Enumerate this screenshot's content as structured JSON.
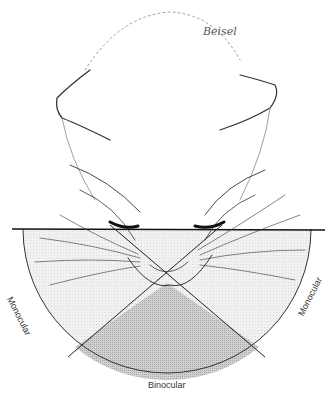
{
  "diagram": {
    "signature": "Beisel",
    "labels": {
      "left": "Monocular",
      "right": "Monocular",
      "bottom": "Binocular"
    },
    "colors": {
      "line": "#222222",
      "monocular_fill": "#efefef",
      "binocular_fill": "#c8c8c8",
      "sketch": "#333333"
    }
  }
}
